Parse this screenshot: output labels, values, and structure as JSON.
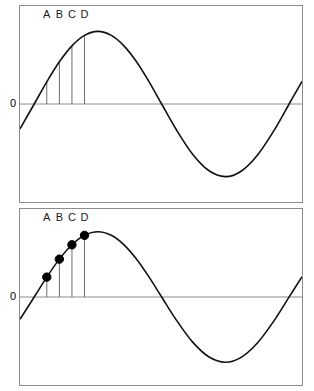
{
  "figure": {
    "title": "",
    "background_color": "#ffffff",
    "panel_border_color": "#8c8c8c",
    "curve_color": "#111111",
    "axis_color": "#8c8c8c",
    "tick_color": "#6e6e6e",
    "marker_color": "#000000"
  },
  "panels": [
    {
      "id": "top",
      "zero_label": "0",
      "tick_labels": [
        "A",
        "B",
        "C",
        "D"
      ],
      "has_markers": false
    },
    {
      "id": "bottom",
      "zero_label": "0",
      "tick_labels": [
        "A",
        "B",
        "C",
        "D"
      ],
      "has_markers": true
    }
  ],
  "chart_data": {
    "type": "line",
    "title": "",
    "xlabel": "",
    "ylabel": "",
    "grid": false,
    "legend": "none",
    "xlim": [
      -0.35,
      6.6
    ],
    "ylim": [
      -1.35,
      1.35
    ],
    "ytick_labels": [
      "0"
    ],
    "ytick_values": [
      0
    ],
    "series": [
      {
        "name": "sine curve",
        "function": "sin(x)",
        "x": [
          -0.35,
          0.0,
          0.31,
          0.62,
          0.93,
          1.24,
          1.571,
          1.9,
          2.2,
          2.5,
          2.8,
          3.1416,
          3.5,
          3.9,
          4.3,
          4.712,
          5.1,
          5.5,
          5.9,
          6.3,
          6.6
        ],
        "y": [
          -0.343,
          0.0,
          0.305,
          0.581,
          0.801,
          0.946,
          1.0,
          0.946,
          0.808,
          0.599,
          0.335,
          0.0,
          -0.351,
          -0.688,
          -0.916,
          -1.0,
          -0.926,
          -0.706,
          -0.374,
          0.017,
          0.312
        ]
      }
    ],
    "annotations": [
      {
        "label": "A",
        "x": 0.31,
        "y": 0.305,
        "marker": "filled-circle",
        "marker_panel": "bottom",
        "tick_from_axis": true
      },
      {
        "label": "B",
        "x": 0.62,
        "y": 0.581,
        "marker": "filled-circle",
        "marker_panel": "bottom",
        "tick_from_axis": true
      },
      {
        "label": "C",
        "x": 0.93,
        "y": 0.801,
        "marker": "filled-circle",
        "marker_panel": "bottom",
        "tick_from_axis": true
      },
      {
        "label": "D",
        "x": 1.24,
        "y": 0.946,
        "marker": "filled-circle",
        "marker_panel": "bottom",
        "tick_from_axis": true
      }
    ]
  }
}
